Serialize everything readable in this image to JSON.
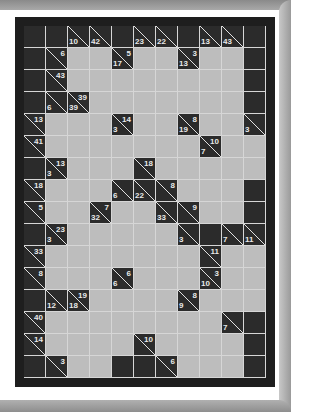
{
  "puzzle": {
    "type": "kakuro",
    "columns": 11,
    "rows": 16,
    "colors": {
      "clue_bg": "#2b2b2b",
      "empty_cell": "#bdbdbd",
      "grid_line": "#d6d6d6",
      "frame": "#1e1e1e",
      "clue_text": "#e8e8e8"
    },
    "grid": [
      [
        "B",
        "B",
        {
          "d": "10"
        },
        {
          "d": "42"
        },
        "B",
        {
          "d": "23"
        },
        {
          "d": "22"
        },
        "B",
        {
          "d": "13"
        },
        {
          "d": "43"
        },
        "B"
      ],
      [
        "B",
        {
          "a": "6"
        },
        "W",
        "W",
        {
          "a": "5",
          "d": "17"
        },
        "W",
        "W",
        {
          "a": "3",
          "d": "13"
        },
        "W",
        "W",
        "B"
      ],
      [
        "B",
        {
          "a": "43"
        },
        "W",
        "W",
        "W",
        "W",
        "W",
        "W",
        "W",
        "W",
        "B"
      ],
      [
        "B",
        {
          "d": "6"
        },
        {
          "a": "39",
          "d": "39"
        },
        "W",
        "W",
        "W",
        "W",
        "W",
        "W",
        "W",
        "B"
      ],
      [
        {
          "a": "13"
        },
        "W",
        "W",
        "W",
        {
          "a": "14",
          "d": "3"
        },
        "W",
        "W",
        {
          "a": "8",
          "d": "19"
        },
        "W",
        "W",
        {
          "d": "3"
        }
      ],
      [
        {
          "a": "41"
        },
        "W",
        "W",
        "W",
        "W",
        "W",
        "W",
        "W",
        {
          "a": "10",
          "d": "7"
        },
        "W",
        "W"
      ],
      [
        "B",
        {
          "a": "13",
          "d": "3"
        },
        "W",
        "W",
        "W",
        {
          "a": "18"
        },
        "W",
        "W",
        "W",
        "W",
        "W"
      ],
      [
        {
          "a": "18"
        },
        "W",
        "W",
        "W",
        {
          "d": "6"
        },
        {
          "d": "22"
        },
        {
          "a": "8"
        },
        "W",
        "W",
        "W",
        "B"
      ],
      [
        {
          "a": "5"
        },
        "W",
        "W",
        {
          "a": "7",
          "d": "32"
        },
        "W",
        "W",
        {
          "d": "33"
        },
        {
          "a": "9"
        },
        "W",
        "W",
        "B"
      ],
      [
        "B",
        {
          "a": "23",
          "d": "3"
        },
        "W",
        "W",
        "W",
        "W",
        "W",
        {
          "d": "3"
        },
        "B",
        {
          "d": "7"
        },
        {
          "d": "11"
        }
      ],
      [
        {
          "a": "33"
        },
        "W",
        "W",
        "W",
        "W",
        "W",
        "W",
        "W",
        {
          "a": "11"
        },
        "W",
        "W"
      ],
      [
        {
          "a": "8"
        },
        "W",
        "W",
        "W",
        {
          "a": "6",
          "d": "6"
        },
        "W",
        "W",
        "W",
        {
          "a": "3",
          "d": "10"
        },
        "W",
        "W"
      ],
      [
        "B",
        {
          "d": "12"
        },
        {
          "a": "19",
          "d": "18"
        },
        "W",
        "W",
        "W",
        "W",
        {
          "a": "8",
          "d": "9"
        },
        "W",
        "W",
        "W"
      ],
      [
        {
          "a": "40"
        },
        "W",
        "W",
        "W",
        "W",
        "W",
        "W",
        "W",
        "W",
        {
          "d": "7"
        },
        "B"
      ],
      [
        {
          "a": "14"
        },
        "W",
        "W",
        "W",
        "W",
        {
          "a": "10"
        },
        "W",
        "W",
        "W",
        "W",
        "B"
      ],
      [
        "B",
        {
          "a": "3"
        },
        "W",
        "W",
        "B",
        "B",
        {
          "a": "6"
        },
        "W",
        "W",
        "W",
        "B"
      ]
    ]
  }
}
